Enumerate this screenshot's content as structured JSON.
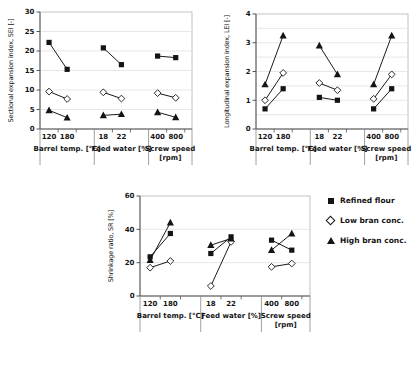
{
  "legend": {
    "items": [
      {
        "label": "Refined flour",
        "marker": "square"
      },
      {
        "label": "Low bran conc.",
        "marker": "diamond"
      },
      {
        "label": "High bran conc.",
        "marker": "triangle"
      }
    ]
  },
  "colors": {
    "marker": "#141414",
    "line": "#1a1a1a",
    "grid": "#dcdcdc",
    "box_border": "#b5b5b5",
    "axis": "#555555",
    "background": "#ffffff"
  },
  "chart_data": [
    {
      "id": "sei",
      "type": "line",
      "title": "",
      "ylabel": "Sectional expansion index, SEI [-]",
      "xlabel": "",
      "ylim": [
        0,
        30
      ],
      "yticks": [
        0,
        5,
        10,
        15,
        20,
        25,
        30
      ],
      "grid_step": 5,
      "grid": "on",
      "legend_position": "none",
      "categories": [
        {
          "label": [
            "Barrel temp. [°C]"
          ],
          "ticks": [
            "120",
            "180"
          ]
        },
        {
          "label": [
            "Feed water [%]"
          ],
          "ticks": [
            "18",
            "22"
          ]
        },
        {
          "label": [
            "Screw speed",
            "[rpm]"
          ],
          "ticks": [
            "400",
            "800"
          ]
        }
      ],
      "series": [
        {
          "name": "Refined flour",
          "marker": "square",
          "values": [
            [
              22.2,
              15.3
            ],
            [
              20.8,
              16.5
            ],
            [
              18.7,
              18.3
            ]
          ]
        },
        {
          "name": "Low bran conc.",
          "marker": "diamond",
          "values": [
            [
              9.6,
              7.7
            ],
            [
              9.4,
              7.8
            ],
            [
              9.2,
              8.0
            ]
          ]
        },
        {
          "name": "High bran conc.",
          "marker": "triangle",
          "values": [
            [
              4.8,
              2.9
            ],
            [
              3.5,
              3.8
            ],
            [
              4.3,
              3.0
            ]
          ]
        }
      ]
    },
    {
      "id": "lei",
      "type": "line",
      "title": "",
      "ylabel": "Longitudinal expansion index, LEI [-]",
      "xlabel": "",
      "ylim": [
        0,
        4
      ],
      "yticks": [
        0,
        1,
        2,
        3,
        4
      ],
      "grid_step": 0.5,
      "grid": "on",
      "legend_position": "none",
      "categories": [
        {
          "label": [
            "Barrel temp. [°C]"
          ],
          "ticks": [
            "120",
            "180"
          ]
        },
        {
          "label": [
            "Feed water [%]"
          ],
          "ticks": [
            "18",
            "22"
          ]
        },
        {
          "label": [
            "Screw speed",
            "[rpm]"
          ],
          "ticks": [
            "400",
            "800"
          ]
        }
      ],
      "series": [
        {
          "name": "Refined flour",
          "marker": "square",
          "values": [
            [
              0.7,
              1.4
            ],
            [
              1.1,
              1.0
            ],
            [
              0.7,
              1.4
            ]
          ]
        },
        {
          "name": "Low bran conc.",
          "marker": "diamond",
          "values": [
            [
              1.0,
              1.95
            ],
            [
              1.6,
              1.35
            ],
            [
              1.05,
              1.9
            ]
          ]
        },
        {
          "name": "High bran conc.",
          "marker": "triangle",
          "values": [
            [
              1.55,
              3.25
            ],
            [
              2.9,
              1.9
            ],
            [
              1.55,
              3.25
            ]
          ]
        }
      ]
    },
    {
      "id": "sr",
      "type": "line",
      "title": "",
      "ylabel": "Shrinkage ratio, SR [%]",
      "xlabel": "",
      "ylim": [
        0,
        60
      ],
      "yticks": [
        0,
        20,
        40,
        60
      ],
      "grid_step": 20,
      "grid": "on",
      "legend_position": "right",
      "categories": [
        {
          "label": [
            "Barrel temp. [°C]"
          ],
          "ticks": [
            "120",
            "180"
          ]
        },
        {
          "label": [
            "Feed water [%]"
          ],
          "ticks": [
            "18",
            "22"
          ]
        },
        {
          "label": [
            "Screw speed",
            "[rpm]"
          ],
          "ticks": [
            "400",
            "800"
          ]
        }
      ],
      "series": [
        {
          "name": "Refined flour",
          "marker": "square",
          "values": [
            [
              23.5,
              37.5
            ],
            [
              25.5,
              35.5
            ],
            [
              33.5,
              27.5
            ]
          ]
        },
        {
          "name": "Low bran conc.",
          "marker": "diamond",
          "values": [
            [
              17.0,
              21.0
            ],
            [
              6.0,
              32.5
            ],
            [
              17.5,
              19.5
            ]
          ]
        },
        {
          "name": "High bran conc.",
          "marker": "triangle",
          "values": [
            [
              21.5,
              44.0
            ],
            [
              30.5,
              34.5
            ],
            [
              27.5,
              37.5
            ]
          ]
        }
      ]
    }
  ]
}
